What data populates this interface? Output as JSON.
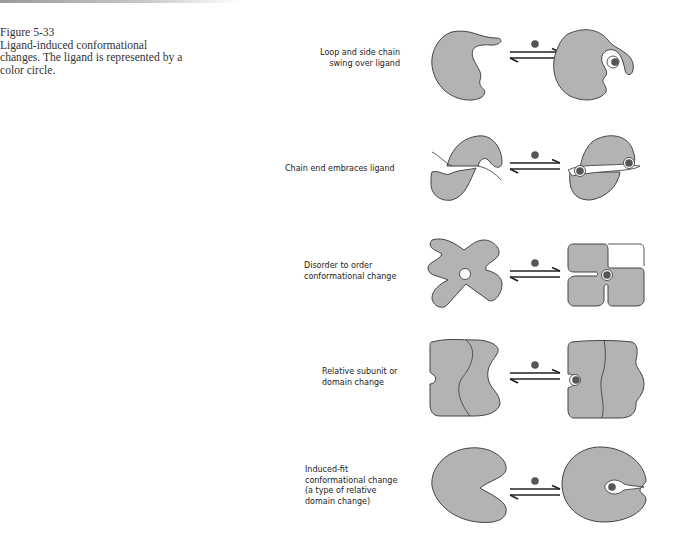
{
  "figure": {
    "number": "Figure 5-33",
    "caption_line1": "Ligand-induced conformational",
    "caption_line2": "changes. The ligand is represented by a",
    "caption_line3": "color circle."
  },
  "rows": [
    {
      "id": "loop",
      "label_lines": [
        "Loop and side chain",
        "swing over ligand"
      ]
    },
    {
      "id": "chain-end",
      "label_lines": [
        "Chain end embraces ligand"
      ]
    },
    {
      "id": "disorder-order",
      "label_lines": [
        "Disorder to order",
        "conformational change"
      ]
    },
    {
      "id": "subunit",
      "label_lines": [
        "Relative subunit or",
        "domain change"
      ]
    },
    {
      "id": "induced-fit",
      "label_lines": [
        "Induced-fit",
        "conformational change",
        "(a type of relative",
        "domain change)"
      ]
    }
  ],
  "colors": {
    "protein_fill": "#b3b3b3",
    "ligand": "#555555",
    "outline": "#444444"
  }
}
